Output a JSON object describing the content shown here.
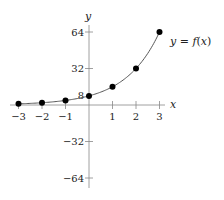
{
  "chart_data": {
    "type": "line",
    "title": "",
    "xlabel": "x",
    "ylabel": "y",
    "curve_label": "y = f(x)",
    "x": [
      -3,
      -2,
      -1,
      0,
      1,
      2,
      3
    ],
    "values": [
      1,
      2,
      4,
      8,
      16,
      32,
      64
    ],
    "series": [
      {
        "name": "y = f(x)",
        "x": [
          -3,
          -2,
          -1,
          0,
          1,
          2,
          3
        ],
        "values": [
          1,
          2,
          4,
          8,
          16,
          32,
          64
        ]
      }
    ],
    "xticks": [
      "-3",
      "-2",
      "-1",
      "1",
      "2",
      "3"
    ],
    "yticks": [
      "64",
      "32",
      "8",
      "-32",
      "-64"
    ],
    "xlim": [
      -3.3,
      3.3
    ],
    "ylim": [
      -70,
      70
    ],
    "grid": false,
    "legend": "none",
    "markers": "filled-circle",
    "colors": {
      "curve": "#555555",
      "points": "#000000",
      "axis": "#888888"
    }
  }
}
